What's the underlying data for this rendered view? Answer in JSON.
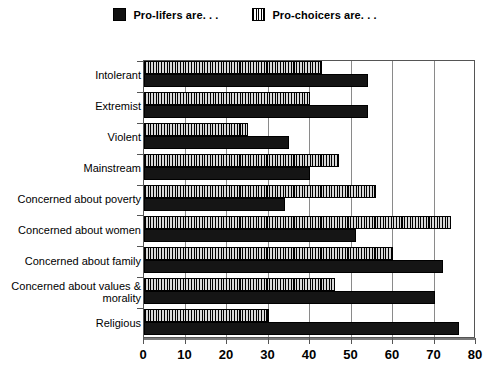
{
  "legend": {
    "entries": [
      {
        "label": "Pro-lifers are. . .",
        "swatch": "solid-black-square-icon",
        "color": "#111111"
      },
      {
        "label": "Pro-choicers are. . .",
        "swatch": "hatched-square-icon",
        "color": "#cfcfcf"
      }
    ]
  },
  "chart_data": {
    "type": "bar",
    "orientation": "horizontal",
    "title": "",
    "xlabel": "",
    "ylabel": "",
    "xlim": [
      0,
      80
    ],
    "xticks": [
      0,
      10,
      20,
      30,
      40,
      50,
      60,
      70,
      80
    ],
    "grid": true,
    "legend_position": "top-center",
    "categories": [
      "Intolerant",
      "Extremist",
      "Violent",
      "Mainstream",
      "Concerned about poverty",
      "Concerned about women",
      "Concerned about family",
      "Concerned about values &\nmorality",
      "Religious"
    ],
    "series": [
      {
        "name": "Pro-lifers are. . .",
        "values": [
          54,
          54,
          35,
          40,
          34,
          51,
          72,
          70,
          76
        ]
      },
      {
        "name": "Pro-choicers are. . .",
        "values": [
          43,
          40,
          25,
          47,
          56,
          74,
          60,
          46,
          30
        ]
      }
    ]
  }
}
